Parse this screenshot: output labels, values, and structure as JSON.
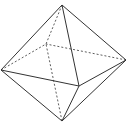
{
  "diagram": {
    "type": "octahedron-wireframe",
    "background": "#ffffff",
    "stroke_color": "#333333",
    "vertices": {
      "top": [
        62,
        5
      ],
      "bottom": [
        62,
        121
      ],
      "left": [
        1,
        70
      ],
      "right": [
        126,
        60
      ],
      "back": [
        46,
        44
      ],
      "front": [
        79,
        86
      ]
    },
    "solid_edges": [
      [
        "top",
        "left"
      ],
      [
        "top",
        "right"
      ],
      [
        "top",
        "front"
      ],
      [
        "bottom",
        "left"
      ],
      [
        "bottom",
        "right"
      ],
      [
        "bottom",
        "front"
      ],
      [
        "left",
        "front"
      ],
      [
        "right",
        "front"
      ]
    ],
    "dashed_edges": [
      [
        "top",
        "back"
      ],
      [
        "bottom",
        "back"
      ],
      [
        "left",
        "back"
      ],
      [
        "right",
        "back"
      ]
    ]
  }
}
